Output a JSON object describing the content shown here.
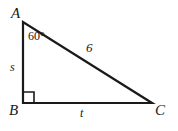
{
  "figure": {
    "type": "right-triangle-diagram",
    "background_color": "#ffffff",
    "stroke_color": "#1a1a1a",
    "vertices": [
      {
        "name": "A",
        "label": "A",
        "x": 23,
        "y": 22,
        "position": "top-left"
      },
      {
        "name": "B",
        "label": "B",
        "x": 23,
        "y": 103,
        "position": "bottom-left"
      },
      {
        "name": "C",
        "label": "C",
        "x": 152,
        "y": 103,
        "position": "bottom-right"
      }
    ],
    "angles": [
      {
        "at_vertex": "A",
        "label": "60°",
        "value": 60,
        "unit": "degrees"
      },
      {
        "at_vertex": "B",
        "label": "",
        "value": 90,
        "unit": "degrees",
        "marker": "right-angle-square"
      }
    ],
    "sides": [
      {
        "name": "AB",
        "label": "s",
        "kind": "variable",
        "position": "left-leg"
      },
      {
        "name": "BC",
        "label": "t",
        "kind": "variable",
        "position": "bottom-leg"
      },
      {
        "name": "AC",
        "label": "6",
        "kind": "measure",
        "position": "hypotenuse"
      }
    ]
  }
}
